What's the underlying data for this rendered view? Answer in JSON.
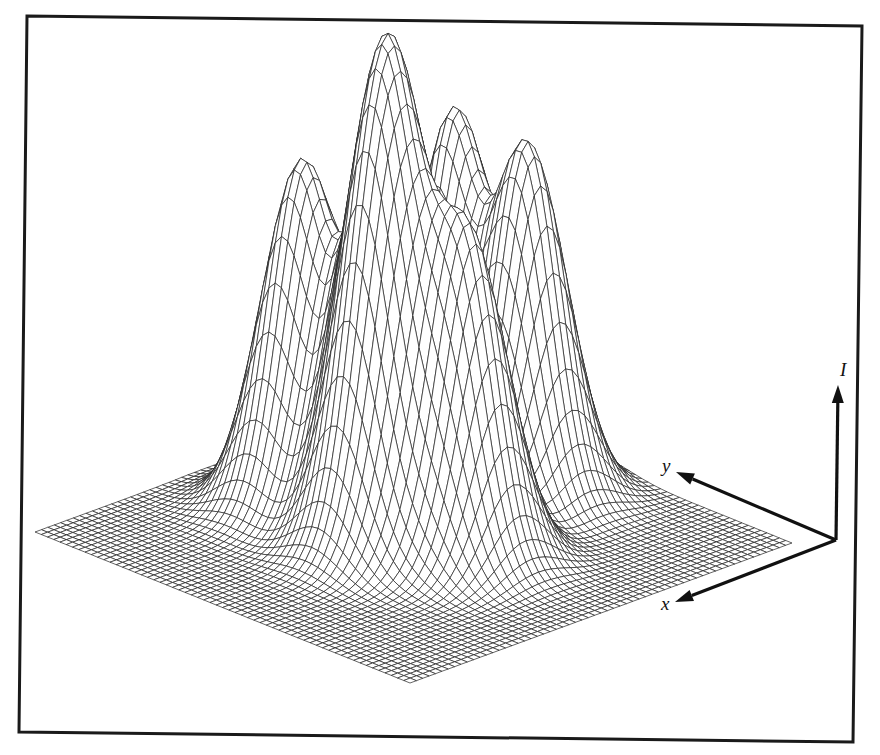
{
  "figure": {
    "colors": {
      "line": "#222222",
      "background": "#ffffff",
      "frame": "#1a1a1a"
    },
    "frame": {
      "corners": [
        [
          27,
          16
        ],
        [
          862,
          26
        ],
        [
          853,
          742
        ],
        [
          19,
          732
        ]
      ]
    },
    "axes": {
      "origin": [
        836,
        540
      ],
      "I": {
        "label": "I",
        "tip": [
          838,
          385
        ],
        "label_pos": [
          840,
          376
        ]
      },
      "y": {
        "label": "y",
        "tip": [
          676,
          472
        ],
        "label_pos": [
          662,
          472
        ]
      },
      "x": {
        "label": "x",
        "tip": [
          675,
          602
        ],
        "label_pos": [
          661,
          610
        ]
      }
    },
    "surface": {
      "grid_n": 60,
      "plane": {
        "right": [
          792,
          543
        ],
        "front": [
          410,
          683
        ],
        "left": [
          35,
          532
        ]
      },
      "peaks": [
        {
          "u": 0.55,
          "v": 0.75,
          "height": 340,
          "sigma": 0.075
        },
        {
          "u": 0.6,
          "v": 0.5,
          "height": 317,
          "sigma": 0.075
        },
        {
          "u": 0.5,
          "v": 0.55,
          "height": 327,
          "sigma": 0.075
        },
        {
          "u": 0.2,
          "v": 0.7,
          "height": 349,
          "sigma": 0.075
        },
        {
          "u": 0.2,
          "v": 0.5,
          "height": 344,
          "sigma": 0.075
        },
        {
          "u": 0.5,
          "v": 0.35,
          "height": 310,
          "sigma": 0.075
        }
      ]
    }
  }
}
